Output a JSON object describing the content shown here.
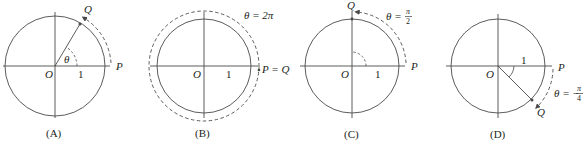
{
  "figure": {
    "colors": {
      "stroke": "#4a4a4a",
      "text": "#231f20",
      "background": "#ffffff"
    },
    "panels": [
      {
        "caption": "(A)",
        "origin_label": "O",
        "unit_label": "1",
        "p_label": "P",
        "q_label": "Q",
        "angle_label": "θ",
        "description": "Unit circle with point Q at positive angle θ counterclockwise from P"
      },
      {
        "caption": "(B)",
        "origin_label": "O",
        "unit_label": "1",
        "pq_label": "P = Q",
        "angle_label": "θ = 2π",
        "description": "Full counterclockwise revolution; Q coincides with P"
      },
      {
        "caption": "(C)",
        "origin_label": "O",
        "unit_label": "1",
        "p_label": "P",
        "q_label": "Q",
        "angle_label_prefix": "θ =",
        "angle_num": "π",
        "angle_den": "2",
        "description": "Quarter turn counterclockwise; Q at top of circle"
      },
      {
        "caption": "(D)",
        "origin_label": "O",
        "unit_label": "1",
        "p_label": "P",
        "q_label": "Q",
        "angle_label_prefix": "θ = −",
        "angle_num": "π",
        "angle_den": "4",
        "description": "Clockwise rotation by π/4; Q in fourth quadrant"
      }
    ]
  }
}
